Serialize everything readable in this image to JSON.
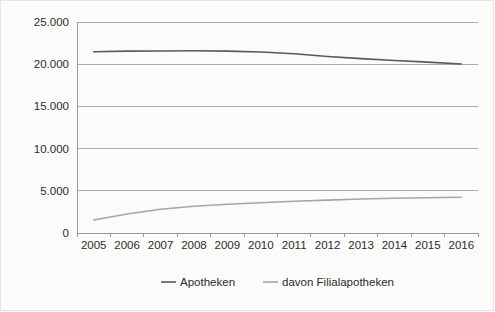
{
  "chart_data": {
    "type": "line",
    "title": "",
    "subtitle": "",
    "xlabel": "",
    "ylabel": "",
    "categories": [
      "2005",
      "2006",
      "2007",
      "2008",
      "2009",
      "2010",
      "2011",
      "2012",
      "2013",
      "2014",
      "2015",
      "2016"
    ],
    "series": [
      {
        "name": "Apotheken",
        "color": "#595959",
        "values": [
          21476,
          21551,
          21570,
          21602,
          21548,
          21441,
          21238,
          20921,
          20662,
          20441,
          20249,
          20023
        ]
      },
      {
        "name": "davon Filialapotheken",
        "color": "#a6a6a6",
        "values": [
          1548,
          2254,
          2810,
          3177,
          3409,
          3592,
          3763,
          3900,
          4022,
          4110,
          4180,
          4241
        ]
      }
    ],
    "ylim": [
      0,
      25000
    ],
    "ytick_values": [
      0,
      5000,
      10000,
      15000,
      20000,
      25000
    ],
    "ytick_labels": [
      "0",
      "5.000",
      "10.000",
      "15.000",
      "20.000",
      "25.000"
    ],
    "grid": true,
    "grid_axis": "y",
    "legend": {
      "position": "bottom",
      "entries": [
        {
          "label": "Apotheken",
          "color": "#595959"
        },
        {
          "label": "davon Filialapotheken",
          "color": "#a6a6a6"
        }
      ]
    },
    "axis_color": "#9a9a9a",
    "grid_color": "#aaaaaa",
    "background_color": "#fbfbfa"
  },
  "plot_geometry": {
    "left": 77,
    "right": 478,
    "top": 22,
    "bottom": 233
  }
}
